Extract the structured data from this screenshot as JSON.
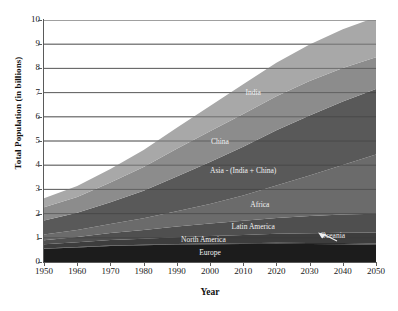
{
  "chart_data": {
    "type": "area",
    "stacked": true,
    "title": "",
    "xlabel": "Year",
    "ylabel": "Total Population (in billions)",
    "xlim": [
      1950,
      2050
    ],
    "ylim": [
      0,
      10
    ],
    "grid": true,
    "grid_axis": "y",
    "legend_position": "inline-labels",
    "x": [
      1950,
      1960,
      1970,
      1980,
      1990,
      2000,
      2010,
      2020,
      2030,
      2040,
      2050
    ],
    "xticks": [
      "1950",
      "1960",
      "1970",
      "1980",
      "1990",
      "2000",
      "2010",
      "2020",
      "2030",
      "2040",
      "2050"
    ],
    "yticks": [
      "0",
      "1",
      "2",
      "3",
      "4",
      "5",
      "6",
      "7",
      "8",
      "9",
      "10"
    ],
    "series": [
      {
        "name": "Europe",
        "color": "#1c1c1c",
        "label_x": 2000,
        "values": [
          0.55,
          0.6,
          0.66,
          0.69,
          0.72,
          0.73,
          0.74,
          0.75,
          0.74,
          0.73,
          0.71
        ]
      },
      {
        "name": "Oceania",
        "color": "#2e2e2e",
        "label_x": 2037,
        "values": [
          0.013,
          0.016,
          0.019,
          0.023,
          0.027,
          0.031,
          0.037,
          0.043,
          0.048,
          0.053,
          0.057
        ]
      },
      {
        "name": "North America",
        "color": "#3d3d3d",
        "label_x": 1998,
        "values": [
          0.17,
          0.2,
          0.23,
          0.25,
          0.28,
          0.31,
          0.34,
          0.37,
          0.4,
          0.43,
          0.45
        ]
      },
      {
        "name": "Latin America",
        "color": "#4f4f4f",
        "label_x": 2013,
        "values": [
          0.17,
          0.22,
          0.29,
          0.36,
          0.44,
          0.52,
          0.59,
          0.66,
          0.71,
          0.75,
          0.78
        ]
      },
      {
        "name": "Africa",
        "color": "#6b6b6b",
        "label_x": 2015,
        "values": [
          0.23,
          0.29,
          0.37,
          0.48,
          0.63,
          0.81,
          1.04,
          1.34,
          1.68,
          2.05,
          2.45
        ]
      },
      {
        "name": "Asia - (India + China)",
        "color": "#595959",
        "label_x": 2010,
        "values": [
          0.58,
          0.71,
          0.9,
          1.14,
          1.44,
          1.73,
          2.02,
          2.28,
          2.48,
          2.62,
          2.7
        ]
      },
      {
        "name": "China",
        "color": "#8c8c8c",
        "label_x": 2003,
        "values": [
          0.55,
          0.65,
          0.82,
          0.98,
          1.14,
          1.27,
          1.35,
          1.41,
          1.42,
          1.38,
          1.31
        ]
      },
      {
        "name": "India",
        "color": "#a8a8a8",
        "label_x": 2013,
        "values": [
          0.37,
          0.45,
          0.55,
          0.7,
          0.87,
          1.05,
          1.23,
          1.38,
          1.51,
          1.6,
          1.66
        ]
      }
    ],
    "totals": [
      2.63,
      3.14,
      3.84,
      4.61,
      5.55,
      6.46,
      7.35,
      8.19,
      8.97,
      9.61,
      10.07
    ],
    "annotations": [
      {
        "name": "oceania-pointer",
        "text": "",
        "kind": "arrow",
        "points_to": "Oceania"
      }
    ]
  }
}
